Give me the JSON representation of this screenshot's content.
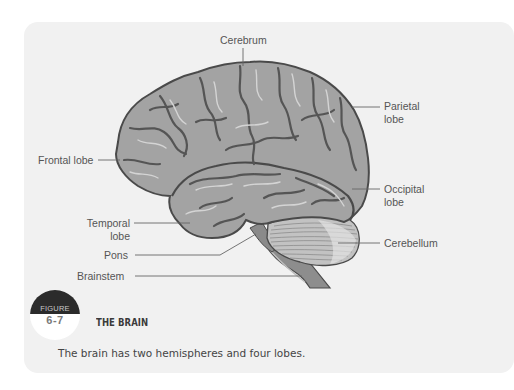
{
  "figure": {
    "badge_word": "FIGURE",
    "number": "6-7",
    "title": "THE BRAIN",
    "caption": "The brain has two hemispheres and four lobes."
  },
  "labels": {
    "cerebrum": "Cerebrum",
    "parietal_1": "Parietal",
    "parietal_2": "lobe",
    "frontal": "Frontal lobe",
    "occipital_1": "Occipital",
    "occipital_2": "lobe",
    "temporal_1": "Temporal",
    "temporal_2": "lobe",
    "cerebellum": "Cerebellum",
    "pons": "Pons",
    "brainstem": "Brainstem"
  },
  "colors": {
    "panel_bg": "#f1f1f1",
    "brain_fill": "#a3a3a3",
    "brain_outline": "#4a4a4a",
    "sulci": "#5a5a5a",
    "highlight": "#d2d2d2",
    "cerebellum_fill": "#c4c4c4",
    "leader_line": "#666666",
    "badge_dark": "#2b2b2b"
  }
}
